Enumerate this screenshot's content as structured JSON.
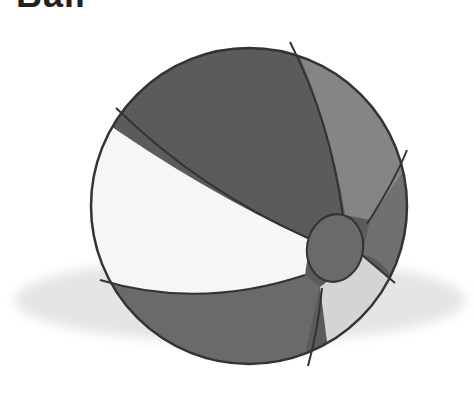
{
  "title": "Ball",
  "image": {
    "subject": "beach-ball",
    "colors": {
      "dark_panel": "#5a5a5a",
      "mid_panel": "#808080",
      "light_panel": "#f4f4f4",
      "pale_panel": "#d8d8d8",
      "cap": "#6a6a6a",
      "outline": "#333333",
      "shadow": "#e2e2e2"
    }
  }
}
